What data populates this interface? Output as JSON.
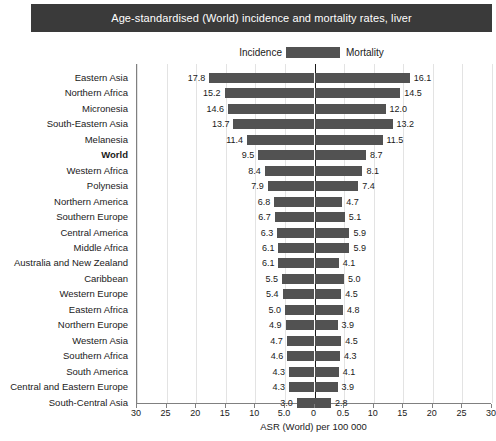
{
  "header": {
    "title": "Age-standardised (World) incidence and mortality rates, liver",
    "bar_color": "#3a3a3a",
    "text_color": "#ffffff"
  },
  "legend": {
    "left_label": "Incidence",
    "right_label": "Mortality",
    "swatch_color": "#525252"
  },
  "axis": {
    "title": "ASR (World) per 100 000",
    "tick_labels": [
      "30",
      "25",
      "20",
      "15",
      "10",
      "5.0",
      "0",
      "0.5",
      "10",
      "15",
      "20",
      "25",
      "30"
    ],
    "tick_values": [
      -30,
      -25,
      -20,
      -15,
      -10,
      -5,
      0,
      5,
      10,
      15,
      20,
      25,
      30
    ],
    "max": 30,
    "grid": true
  },
  "chart_data": {
    "type": "bar",
    "title": "Age-standardised (World) incidence and mortality rates, liver",
    "subtitle": "",
    "xlabel": "ASR (World) per 100 000",
    "ylabel": "",
    "xlim": [
      -30,
      30
    ],
    "grid": true,
    "legend_position": "top-center",
    "orientation": "horizontal-bidirectional",
    "categories": [
      "Eastern Asia",
      "Northern Africa",
      "Micronesia",
      "South-Eastern Asia",
      "Melanesia",
      "World",
      "Western Africa",
      "Polynesia",
      "Northern America",
      "Southern Europe",
      "Central America",
      "Middle Africa",
      "Australia and New Zealand",
      "Caribbean",
      "Western Europe",
      "Eastern Africa",
      "Northern Europe",
      "Western Asia",
      "Southern Africa",
      "South America",
      "Central and Eastern Europe",
      "South-Central Asia"
    ],
    "highlight_category": "World",
    "series": [
      {
        "name": "Incidence",
        "direction": "left",
        "values": [
          17.8,
          15.2,
          14.6,
          13.7,
          11.4,
          9.5,
          8.4,
          7.9,
          6.8,
          6.7,
          6.3,
          6.1,
          6.1,
          5.5,
          5.4,
          5.0,
          4.9,
          4.7,
          4.6,
          4.3,
          4.3,
          3.0
        ],
        "labels": [
          "17.8",
          "15.2",
          "14.6",
          "13.7",
          "11.4",
          "9.5",
          "8.4",
          "7.9",
          "6.8",
          "6.7",
          "6.3",
          "6.1",
          "6.1",
          "5.5",
          "5.4",
          "5.0",
          "4.9",
          "4.7",
          "4.6",
          "4.3",
          "4.3",
          "3.0"
        ]
      },
      {
        "name": "Mortality",
        "direction": "right",
        "values": [
          16.1,
          14.5,
          12.0,
          13.2,
          11.5,
          8.7,
          8.1,
          7.4,
          4.7,
          5.1,
          5.9,
          5.9,
          4.1,
          5.0,
          4.5,
          4.8,
          3.9,
          4.5,
          4.3,
          4.1,
          3.9,
          2.8
        ],
        "labels": [
          "16.1",
          "14.5",
          "12.0",
          "13.2",
          "11.5",
          "8.7",
          "8.1",
          "7.4",
          "4.7",
          "5.1",
          "5.9",
          "5.9",
          "4.1",
          "5.0",
          "4.5",
          "4.8",
          "3.9",
          "4.5",
          "4.3",
          "4.1",
          "3.9",
          "2.8"
        ]
      }
    ]
  }
}
